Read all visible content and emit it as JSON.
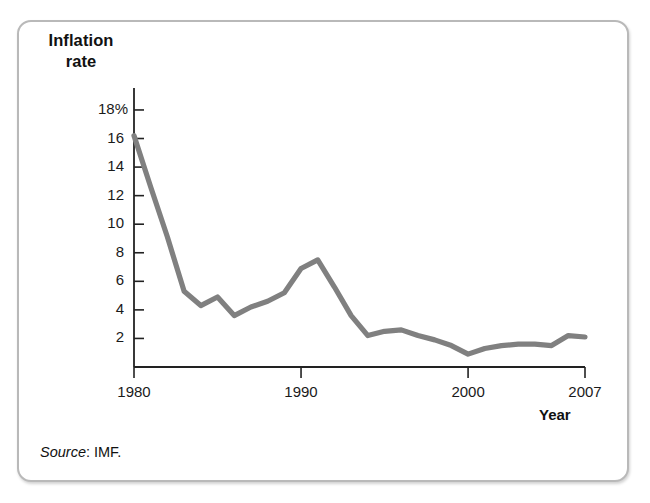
{
  "figure": {
    "y_axis_title": "Inflation\nrate",
    "x_axis_title": "Year",
    "source_label": "Source",
    "source_value": ": IMF."
  },
  "chart_data": {
    "type": "line",
    "title": "",
    "xlabel": "Year",
    "ylabel": "Inflation rate",
    "grid": false,
    "legend": "none",
    "line_color": "#808080",
    "xlim": [
      1980,
      2007
    ],
    "ylim": [
      0,
      18
    ],
    "xticks": [
      1980,
      1990,
      2000,
      2007
    ],
    "xtick_labels": [
      "1980",
      "1990",
      "2000",
      "2007"
    ],
    "yticks": [
      2,
      4,
      6,
      8,
      10,
      12,
      14,
      16,
      18
    ],
    "ytick_labels": [
      "2",
      "4",
      "6",
      "8",
      "10",
      "12",
      "14",
      "16",
      "18%"
    ],
    "x": [
      1980,
      1981,
      1982,
      1983,
      1984,
      1985,
      1986,
      1987,
      1988,
      1989,
      1990,
      1991,
      1992,
      1993,
      1994,
      1995,
      1996,
      1997,
      1998,
      1999,
      2000,
      2001,
      2002,
      2003,
      2004,
      2005,
      2006,
      2007
    ],
    "values": [
      16.2,
      12.6,
      9.1,
      5.3,
      4.3,
      4.9,
      3.6,
      4.2,
      4.6,
      5.2,
      6.9,
      7.5,
      5.6,
      3.6,
      2.2,
      2.5,
      2.6,
      2.2,
      1.9,
      1.5,
      0.9,
      1.3,
      1.5,
      1.6,
      1.6,
      1.5,
      2.2,
      2.1
    ]
  }
}
